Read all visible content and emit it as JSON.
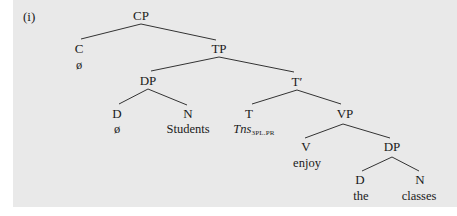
{
  "example_label": "(i)",
  "colors": {
    "panel_background": "#e9e9e9",
    "line": "#333333",
    "text": "#1a1a1a"
  },
  "tree": {
    "nodes": {
      "cp": "CP",
      "c": "C",
      "c_leaf": "ø",
      "tp": "TP",
      "dp_subj": "DP",
      "d_subj": "D",
      "d_subj_leaf": "ø",
      "n_subj": "N",
      "n_subj_leaf": "Students",
      "tbar": "T′",
      "t": "T",
      "t_leaf_main": "Tns",
      "t_leaf_sub": "3PL.PR",
      "vp": "VP",
      "v": "V",
      "v_leaf": "enjoy",
      "dp_obj": "DP",
      "d_obj": "D",
      "d_obj_leaf": "the",
      "n_obj": "N",
      "n_obj_leaf": "classes"
    },
    "edges": [
      [
        "CP",
        "C"
      ],
      [
        "CP",
        "TP"
      ],
      [
        "TP",
        "DP"
      ],
      [
        "TP",
        "T′"
      ],
      [
        "DP",
        "D"
      ],
      [
        "DP",
        "N"
      ],
      [
        "T′",
        "T"
      ],
      [
        "T′",
        "VP"
      ],
      [
        "VP",
        "V"
      ],
      [
        "VP",
        "DP"
      ],
      [
        "DP",
        "D"
      ],
      [
        "DP",
        "N"
      ]
    ]
  }
}
